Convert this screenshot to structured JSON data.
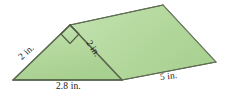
{
  "figure": {
    "name": "triangular-prism",
    "colors": {
      "face_front_fill": "#b2d79b",
      "face_top_fill": "#b9dca4",
      "face_highlight": "#c8e4b6",
      "edge_stroke": "#5d6b52",
      "edge_stroke_light": "#7d8a70",
      "label_text": "#1a1a1a",
      "background": "#ffffff"
    },
    "right_angle_marker": {
      "present": true,
      "location": "apex-of-front-triangle"
    },
    "labels": {
      "left_leg": "2 in.",
      "right_leg": "2 in.",
      "base": "2.8 in.",
      "depth": "5 in."
    },
    "vertices": {
      "front_bottom_left": [
        13,
        80
      ],
      "front_apex": [
        70,
        25
      ],
      "front_bottom_right": [
        122,
        80
      ],
      "back_apex": [
        163,
        5
      ],
      "back_bottom_right": [
        216,
        62
      ]
    }
  }
}
